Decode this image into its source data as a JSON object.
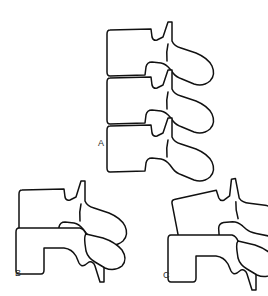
{
  "figure": {
    "background_color": "#ffffff",
    "line_color": "#111111",
    "label_color": "#2b2b2b",
    "cut_off_header_text": "",
    "panels": [
      {
        "id": "A",
        "label": "A",
        "description": "Three stacked lumbar vertebrae in normal alignment, lateral view",
        "vertebra_count": 3
      },
      {
        "id": "B",
        "label": "B",
        "description": "Two lumbar vertebrae, lateral view with anterior offset",
        "vertebra_count": 2
      },
      {
        "id": "C",
        "label": "C",
        "description": "Two lumbar vertebrae, upper segment rotated/tilted",
        "vertebra_count": 2
      }
    ]
  }
}
